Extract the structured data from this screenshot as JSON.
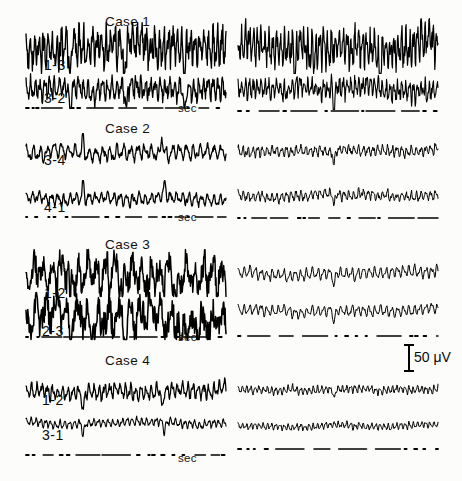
{
  "figure": {
    "background_color": "#fcfcfa",
    "ink_color": "#000000"
  },
  "calibration": {
    "label": "50 μV",
    "amplitude_uv": 50,
    "name": "amplitude-calibration-bar"
  },
  "time_axis_label": "sec",
  "cases": [
    {
      "title": "Case 1",
      "channels": [
        "1-3",
        "3-2"
      ],
      "left_axis_label": "sec",
      "right_axis_label": ""
    },
    {
      "title": "Case 2",
      "channels": [
        "3-4",
        "4-1"
      ],
      "left_axis_label": "sec",
      "right_axis_label": ""
    },
    {
      "title": "Case 3",
      "channels": [
        "1-2",
        "2-3"
      ],
      "left_axis_label": "sec",
      "right_axis_label": ""
    },
    {
      "title": "Case 4",
      "channels": [
        "1-2",
        "3-1"
      ],
      "left_axis_label": "sec",
      "right_axis_label": ""
    }
  ],
  "chart_data": {
    "type": "line",
    "xlabel": "sec",
    "ylabel": "50 μV",
    "grid": false,
    "legend": "none",
    "columns": [
      "left",
      "right"
    ],
    "ylim": [
      -50,
      50
    ],
    "series": [
      {
        "name": "Case 1 / 1-3 (left)",
        "case": "Case 1",
        "channel": "1-3",
        "column": "left",
        "amplitude_uv": 46,
        "dominant_hz": 14,
        "spike_events": 3,
        "character": "high-amplitude fast activity with sharp transients"
      },
      {
        "name": "Case 1 / 3-2 (left)",
        "case": "Case 1",
        "channel": "3-2",
        "column": "left",
        "amplitude_uv": 34,
        "dominant_hz": 13,
        "spike_events": 3,
        "character": "fast activity with paired sharp transients"
      },
      {
        "name": "Case 1 / 1-3 (right)",
        "case": "Case 1",
        "channel": "1-3",
        "column": "right",
        "amplitude_uv": 42,
        "dominant_hz": 16,
        "spike_events": 2,
        "character": "dense fast low-voltage activity"
      },
      {
        "name": "Case 1 / 3-2 (right)",
        "case": "Case 1",
        "channel": "3-2",
        "column": "right",
        "amplitude_uv": 30,
        "dominant_hz": 16,
        "spike_events": 1,
        "character": "dense fast low-voltage activity"
      },
      {
        "name": "Case 2 / 3-4 (left)",
        "case": "Case 2",
        "channel": "3-4",
        "column": "left",
        "amplitude_uv": 26,
        "dominant_hz": 9,
        "spike_events": 2,
        "character": "moderate mixed-frequency activity"
      },
      {
        "name": "Case 2 / 4-1 (left)",
        "case": "Case 2",
        "channel": "4-1",
        "column": "left",
        "amplitude_uv": 22,
        "dominant_hz": 10,
        "spike_events": 2,
        "character": "moderate mixed-frequency activity"
      },
      {
        "name": "Case 2 / 3-4 (right)",
        "case": "Case 2",
        "channel": "3-4",
        "column": "right",
        "amplitude_uv": 20,
        "dominant_hz": 13,
        "spike_events": 1,
        "character": "low-voltage fast activity"
      },
      {
        "name": "Case 2 / 4-1 (right)",
        "case": "Case 2",
        "channel": "4-1",
        "column": "right",
        "amplitude_uv": 19,
        "dominant_hz": 13,
        "spike_events": 1,
        "character": "low-voltage fast activity"
      },
      {
        "name": "Case 3 / 1-2 (left)",
        "case": "Case 3",
        "channel": "1-2",
        "column": "left",
        "amplitude_uv": 48,
        "dominant_hz": 7,
        "spike_events": 3,
        "character": "very high-amplitude rhythmic slow with superimposed fast"
      },
      {
        "name": "Case 3 / 2-3 (left)",
        "case": "Case 3",
        "channel": "2-3",
        "column": "left",
        "amplitude_uv": 50,
        "dominant_hz": 6,
        "spike_events": 3,
        "character": "very high-amplitude rhythmic slow with sharp downward spikes"
      },
      {
        "name": "Case 3 / 1-2 (right)",
        "case": "Case 3",
        "channel": "1-2",
        "column": "right",
        "amplitude_uv": 22,
        "dominant_hz": 11,
        "spike_events": 1,
        "character": "regular moderate-voltage rhythm"
      },
      {
        "name": "Case 3 / 2-3 (right)",
        "case": "Case 3",
        "channel": "2-3",
        "column": "right",
        "amplitude_uv": 20,
        "dominant_hz": 11,
        "spike_events": 1,
        "character": "regular moderate-voltage rhythm"
      },
      {
        "name": "Case 4 / 1-2 (left)",
        "case": "Case 4",
        "channel": "1-2",
        "column": "left",
        "amplitude_uv": 28,
        "dominant_hz": 12,
        "spike_events": 2,
        "character": "moderate fast activity with two transients"
      },
      {
        "name": "Case 4 / 3-1 (left)",
        "case": "Case 4",
        "channel": "3-1",
        "column": "left",
        "amplitude_uv": 18,
        "dominant_hz": 13,
        "spike_events": 2,
        "character": "low-voltage fast activity with two transients"
      },
      {
        "name": "Case 4 / 1-2 (right)",
        "case": "Case 4",
        "channel": "1-2",
        "column": "right",
        "amplitude_uv": 17,
        "dominant_hz": 15,
        "spike_events": 1,
        "character": "low-voltage fast activity"
      },
      {
        "name": "Case 4 / 3-1 (right)",
        "case": "Case 4",
        "channel": "3-1",
        "column": "right",
        "amplitude_uv": 15,
        "dominant_hz": 15,
        "spike_events": 0,
        "character": "low-voltage fast activity"
      }
    ]
  }
}
